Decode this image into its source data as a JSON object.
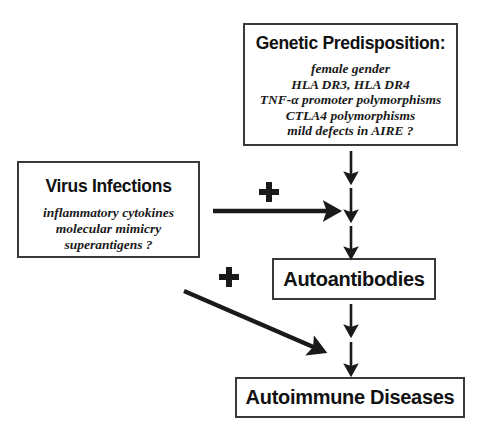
{
  "diagram": {
    "boxes": {
      "genetic": {
        "title": "Genetic Predisposition:",
        "items": [
          "female gender",
          "HLA DR3, HLA DR4",
          "TNF-α promoter polymorphisms",
          "CTLA4 polymorphisms",
          "mild defects in AIRE ?"
        ]
      },
      "virus": {
        "title": "Virus Infections",
        "items": [
          "inflammatory cytokines",
          "molecular mimicry",
          "superantigens ?"
        ]
      },
      "autoantibodies": {
        "title": "Autoantibodies"
      },
      "diseases": {
        "title": "Autoimmune Diseases"
      }
    },
    "operators": [
      {
        "label": "+",
        "name": "plus-sign-virus-genetic"
      },
      {
        "label": "+",
        "name": "plus-sign-virus-autoantibodies"
      }
    ],
    "arrows": [
      {
        "name": "arrow-genetic-down-1",
        "direction": "down"
      },
      {
        "name": "arrow-genetic-down-2",
        "direction": "down"
      },
      {
        "name": "arrow-genetic-down-3",
        "direction": "down"
      },
      {
        "name": "arrow-virus-right",
        "direction": "right"
      },
      {
        "name": "arrow-virus-diagonal",
        "direction": "down-right"
      },
      {
        "name": "arrow-autoantibodies-down-1",
        "direction": "down"
      },
      {
        "name": "arrow-autoantibodies-down-2",
        "direction": "down"
      }
    ],
    "colors": {
      "ink": "#1a1a1a",
      "border": "#3a3a3a",
      "background": "#ffffff"
    }
  }
}
